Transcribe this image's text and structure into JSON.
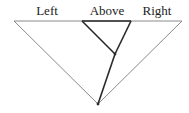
{
  "diagram": {
    "labels": {
      "left": "Left",
      "above": "Above",
      "right": "Right"
    },
    "label_positions": {
      "left": [
        47,
        15
      ],
      "above": [
        107,
        15
      ],
      "right": [
        157,
        15
      ]
    },
    "points": {
      "top_left": [
        14,
        21
      ],
      "top_right": [
        182,
        21
      ],
      "inner_left": [
        82,
        21
      ],
      "inner_right": [
        131,
        21
      ],
      "junction": [
        115,
        54
      ],
      "bottom": [
        98,
        104
      ]
    },
    "colors": {
      "outer_line": "#8a8a8a",
      "inner_line": "#2a2a2a",
      "text": "#222222",
      "background": "#ffffff"
    }
  }
}
